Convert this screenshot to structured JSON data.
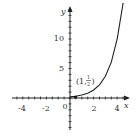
{
  "chart_data": {
    "type": "line",
    "title": "",
    "xlabel": "x",
    "ylabel": "y",
    "xlim": [
      -5,
      4.8
    ],
    "ylim": [
      -6.5,
      16
    ],
    "x_ticks": [
      "-4",
      "-2",
      "0",
      "2",
      "4"
    ],
    "y_ticks": [
      "5",
      "10"
    ],
    "grid": false,
    "series": [
      {
        "name": "curve",
        "x": [
          0,
          0.5,
          1,
          1.5,
          2,
          2.5,
          3,
          3.5,
          4,
          4.5
        ],
        "y": [
          0.18,
          0.3,
          0.5,
          0.82,
          1.36,
          2.24,
          3.69,
          6.09,
          10.04,
          16.56
        ]
      }
    ],
    "annotations": [
      {
        "label_open": "(1,",
        "num": "1",
        "den": "2",
        "label_close": ")",
        "x": 1,
        "y": 0.5
      }
    ]
  }
}
